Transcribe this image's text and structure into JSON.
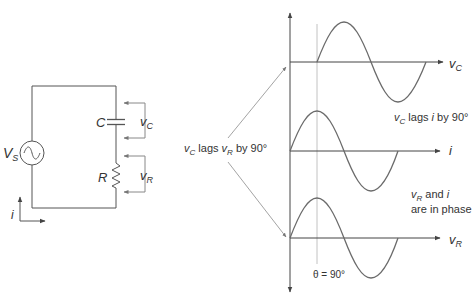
{
  "circuit": {
    "source_label_main": "V",
    "source_label_sub": "S",
    "capacitor_label": "C",
    "resistor_label": "R",
    "vc_label_main": "v",
    "vc_label_sub": "C",
    "vr_label_main": "v",
    "vr_label_sub": "R",
    "current_label": "i"
  },
  "annotation_left": {
    "part1_main": "v",
    "part1_sub": "C",
    "part2": " lags ",
    "part3_main": "v",
    "part3_sub": "R",
    "part4": " by 90°"
  },
  "graphs": {
    "vc_axis_main": "v",
    "vc_axis_sub": "C",
    "i_axis": "i",
    "vr_axis_main": "v",
    "vr_axis_sub": "R",
    "note_vc_i_main": "v",
    "note_vc_i_sub": "C",
    "note_vc_i_rest1": " lags ",
    "note_vc_i_i": "i",
    "note_vc_i_rest2": " by 90°",
    "note_vr_i_line1_main": "v",
    "note_vr_i_line1_sub": "R",
    "note_vr_i_line1_rest": " and ",
    "note_vr_i_line1_i": "i",
    "note_vr_i_line2": "are in phase",
    "theta_label": "θ = 90°"
  },
  "colors": {
    "line": "#555555",
    "wave": "#6b6b6b",
    "guide": "#b5b5b5",
    "text": "#333333"
  }
}
